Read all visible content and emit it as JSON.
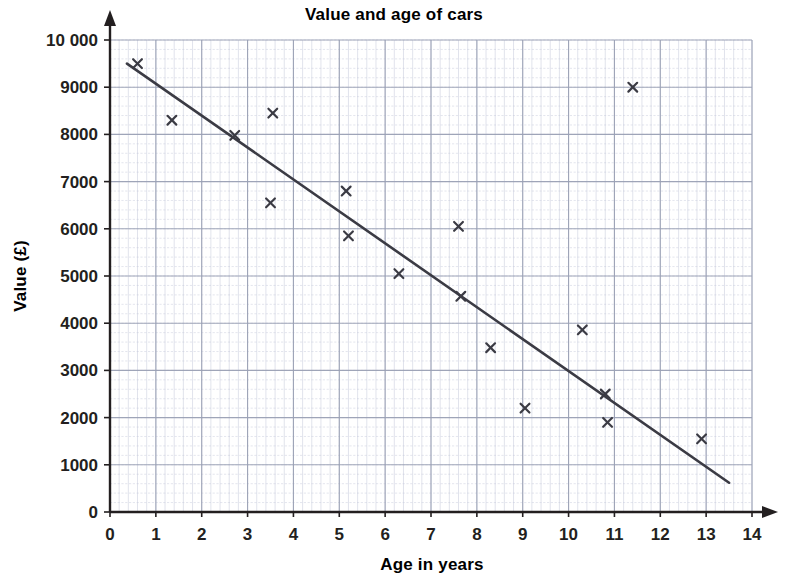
{
  "chart_data": {
    "type": "scatter",
    "title": "Value and age of cars",
    "xlabel": "Age in years",
    "ylabel": "Value (£)",
    "xlim": [
      0,
      14
    ],
    "ylim": [
      0,
      10000
    ],
    "x_ticks": [
      "0",
      "1",
      "2",
      "3",
      "4",
      "5",
      "6",
      "7",
      "8",
      "9",
      "10",
      "11",
      "12",
      "13",
      "14"
    ],
    "y_ticks": [
      "0",
      "1000",
      "2000",
      "3000",
      "4000",
      "5000",
      "6000",
      "7000",
      "8000",
      "9000",
      "10 000"
    ],
    "x_tick_values": [
      0,
      1,
      2,
      3,
      4,
      5,
      6,
      7,
      8,
      9,
      10,
      11,
      12,
      13,
      14
    ],
    "y_tick_values": [
      0,
      1000,
      2000,
      3000,
      4000,
      5000,
      6000,
      7000,
      8000,
      9000,
      10000
    ],
    "x_major_step": 1,
    "y_major_step": 1000,
    "x_minor_step": 0.2,
    "y_minor_step": 200,
    "grid": true,
    "grid_style": "graph-paper",
    "legend": "none",
    "marker": "x-cross",
    "marker_color": "#3b3b44",
    "grid_major_color": "#9aa0b4",
    "grid_minor_color": "#c3c8da",
    "axis_color": "#231f20",
    "trendline_color": "#3b3b44",
    "points": [
      {
        "x": 0.6,
        "y": 9500
      },
      {
        "x": 1.35,
        "y": 8300
      },
      {
        "x": 2.72,
        "y": 7980
      },
      {
        "x": 3.5,
        "y": 6550
      },
      {
        "x": 3.55,
        "y": 8450
      },
      {
        "x": 5.15,
        "y": 6800
      },
      {
        "x": 5.2,
        "y": 5850
      },
      {
        "x": 6.3,
        "y": 5050
      },
      {
        "x": 7.6,
        "y": 6050
      },
      {
        "x": 7.65,
        "y": 4570
      },
      {
        "x": 8.3,
        "y": 3480
      },
      {
        "x": 9.05,
        "y": 2200
      },
      {
        "x": 10.3,
        "y": 3860
      },
      {
        "x": 10.8,
        "y": 2500
      },
      {
        "x": 10.85,
        "y": 1900
      },
      {
        "x": 11.4,
        "y": 9000
      },
      {
        "x": 12.9,
        "y": 1550
      }
    ],
    "trendline": {
      "name": "line of best fit",
      "x_start": 0.37,
      "y_start": 9500,
      "x_end": 13.5,
      "y_end": 620
    }
  }
}
